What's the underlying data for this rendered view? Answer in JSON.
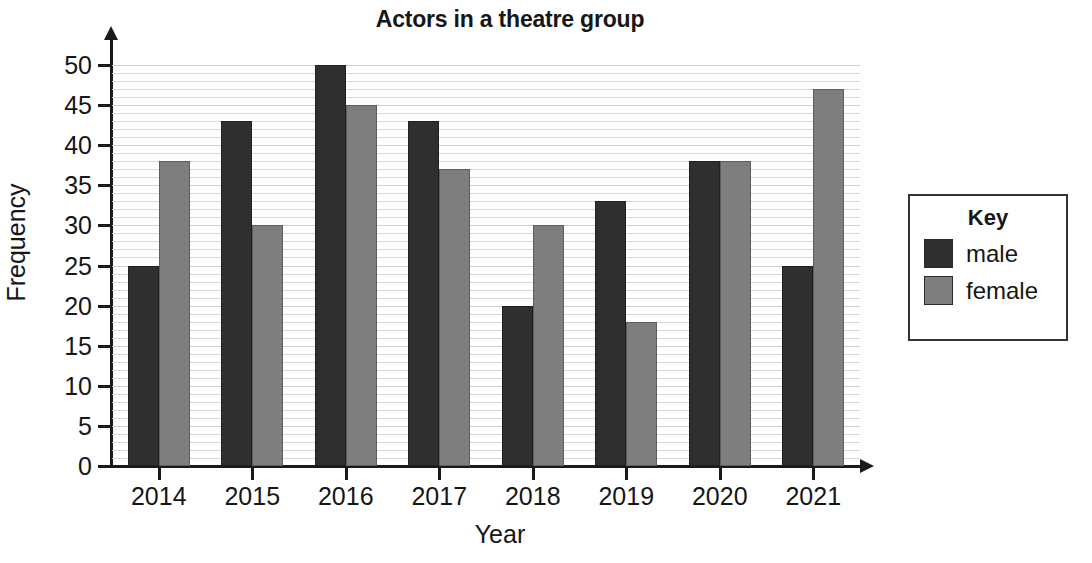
{
  "chart_data": {
    "type": "bar",
    "title": "Actors in a theatre group",
    "xlabel": "Year",
    "ylabel": "Frequency",
    "categories": [
      "2014",
      "2015",
      "2016",
      "2017",
      "2018",
      "2019",
      "2020",
      "2021"
    ],
    "series": [
      {
        "name": "male",
        "color": "#2f2f2f",
        "values": [
          25,
          43,
          50,
          43,
          20,
          33,
          38,
          25
        ]
      },
      {
        "name": "female",
        "color": "#7e7e7e",
        "values": [
          38,
          30,
          45,
          37,
          30,
          18,
          38,
          47
        ]
      }
    ],
    "ylim": [
      0,
      50
    ],
    "ytick_labels": [
      "0",
      "5",
      "10",
      "15",
      "20",
      "25",
      "30",
      "35",
      "40",
      "45",
      "50"
    ],
    "ytick_values": [
      0,
      5,
      10,
      15,
      20,
      25,
      30,
      35,
      40,
      45,
      50
    ],
    "minor_gridline_step": 1,
    "grid": true,
    "legend_position": "right",
    "legend_title": "Key"
  }
}
